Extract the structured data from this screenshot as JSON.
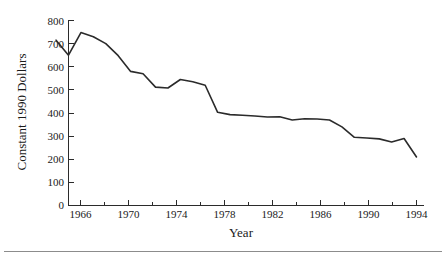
{
  "chart_data": {
    "type": "line",
    "title": "",
    "xlabel": "Year",
    "ylabel": "Constant 1990 Dollars",
    "xlim": [
      1965,
      1994
    ],
    "ylim": [
      0,
      800
    ],
    "grid": false,
    "legend": null,
    "legend_position": "none",
    "line_color": "#2b2b2b",
    "x": [
      1965,
      1966,
      1967,
      1968,
      1969,
      1970,
      1971,
      1972,
      1973,
      1974,
      1975,
      1976,
      1977,
      1978,
      1979,
      1980,
      1981,
      1982,
      1983,
      1984,
      1985,
      1986,
      1987,
      1988,
      1989,
      1990,
      1991,
      1992,
      1993,
      1994
    ],
    "values": [
      715,
      650,
      748,
      730,
      700,
      648,
      580,
      570,
      512,
      508,
      545,
      535,
      520,
      403,
      393,
      390,
      387,
      383,
      384,
      370,
      375,
      374,
      370,
      340,
      295,
      292,
      288,
      275,
      290,
      210
    ],
    "series": [
      {
        "name": "Constant 1990 Dollars",
        "values": [
          715,
          650,
          748,
          730,
          700,
          648,
          580,
          570,
          512,
          508,
          545,
          535,
          520,
          403,
          393,
          390,
          387,
          383,
          384,
          370,
          375,
          374,
          370,
          340,
          295,
          292,
          288,
          275,
          290,
          210
        ]
      }
    ],
    "y_ticks": [
      0,
      100,
      200,
      300,
      400,
      500,
      600,
      700,
      800
    ],
    "y_tick_labels": [
      "0",
      "100",
      "200",
      "300",
      "400",
      "500",
      "600",
      "700",
      "800"
    ],
    "x_ticks": [
      1966,
      1970,
      1974,
      1978,
      1982,
      1986,
      1990,
      1994
    ],
    "x_tick_labels": [
      "1966",
      "1970",
      "1974",
      "1978",
      "1982",
      "1986",
      "1990",
      "1994"
    ],
    "x_minor_ticks": [
      1968,
      1972,
      1976,
      1980,
      1984,
      1988,
      1992
    ]
  },
  "axis": {
    "y_title": "Constant 1990 Dollars",
    "x_title": "Year"
  },
  "y_tick_labels": {
    "t0": "0",
    "t1": "100",
    "t2": "200",
    "t3": "300",
    "t4": "400",
    "t5": "500",
    "t6": "600",
    "t7": "700",
    "t8": "800"
  },
  "x_tick_labels": {
    "t0": "1966",
    "t1": "1970",
    "t2": "1974",
    "t3": "1978",
    "t4": "1982",
    "t5": "1986",
    "t6": "1990",
    "t7": "1994"
  }
}
